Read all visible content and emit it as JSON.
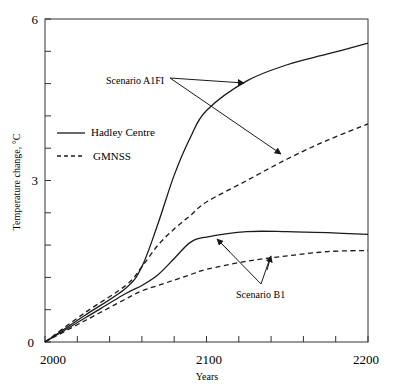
{
  "chart_data": {
    "type": "line",
    "title": "",
    "xlabel": "Years",
    "ylabel": "Temperature change, °C",
    "xlim": [
      2000,
      2200
    ],
    "ylim": [
      0,
      6
    ],
    "x_ticks": [
      2000,
      2100,
      2200
    ],
    "y_ticks": [
      0,
      3,
      6
    ],
    "x_minor_step": 20,
    "y_minor_step": 0.6,
    "grid": false,
    "legend": {
      "position": "upper-left",
      "entries": [
        {
          "label": "Hadley Centre",
          "style": "solid"
        },
        {
          "label": "GMNSS",
          "style": "dashed"
        }
      ]
    },
    "x": [
      2000,
      2025,
      2050,
      2060,
      2070,
      2080,
      2090,
      2100,
      2125,
      2150,
      2175,
      2200
    ],
    "series": [
      {
        "name": "Hadley Centre - Scenario A1FI",
        "style": "solid",
        "values": [
          0,
          0.5,
          1.0,
          1.4,
          2.2,
          3.1,
          3.8,
          4.3,
          4.85,
          5.15,
          5.35,
          5.55
        ]
      },
      {
        "name": "GMNSS - Scenario A1FI",
        "style": "dashed",
        "values": [
          0,
          0.55,
          1.05,
          1.4,
          1.8,
          2.1,
          2.35,
          2.6,
          3.0,
          3.4,
          3.75,
          4.05
        ]
      },
      {
        "name": "Hadley Centre - Scenario B1",
        "style": "solid",
        "values": [
          0,
          0.45,
          0.9,
          1.05,
          1.25,
          1.55,
          1.85,
          1.95,
          2.05,
          2.05,
          2.03,
          2.0
        ]
      },
      {
        "name": "GMNSS - Scenario B1",
        "style": "dashed",
        "values": [
          0,
          0.4,
          0.8,
          0.95,
          1.05,
          1.15,
          1.25,
          1.35,
          1.5,
          1.6,
          1.68,
          1.7
        ]
      }
    ],
    "annotations": [
      {
        "text": "Scenario A1FI",
        "arrows_to": [
          "Hadley Centre - Scenario A1FI at ~2122",
          "GMNSS - Scenario A1FI at ~2143"
        ]
      },
      {
        "text": "Scenario B1",
        "arrows_to": [
          "Hadley Centre - Scenario B1 at ~2100",
          "GMNSS - Scenario B1 at ~2138"
        ]
      }
    ]
  },
  "labels": {
    "y_tick_0": "0",
    "y_tick_3": "3",
    "y_tick_6": "6",
    "x_tick_2000": "2000",
    "x_tick_2100": "2100",
    "x_tick_2200": "2200",
    "xlabel": "Years",
    "ylabel": "Temperature change, °C",
    "legend_hadley": "Hadley Centre",
    "legend_gmnss": "GMNSS",
    "annot_a1fi": "Scenario A1FI",
    "annot_b1": "Scenario B1"
  },
  "colors": {
    "line": "#1a1a1a",
    "background": "#ffffff"
  }
}
